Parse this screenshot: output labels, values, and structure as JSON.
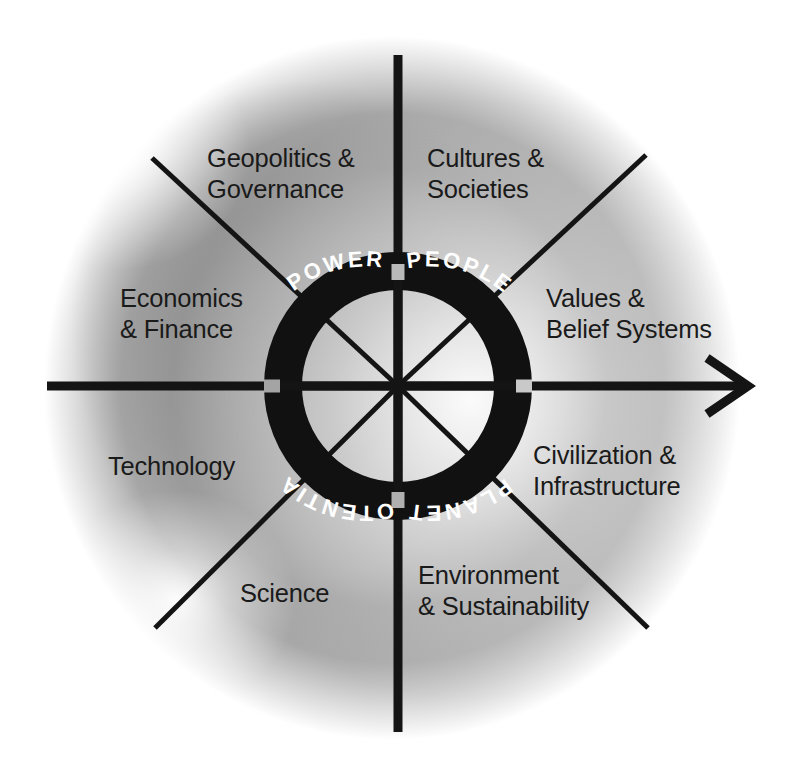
{
  "figure": {
    "type": "conceptual-quadrant-diagram",
    "center": {
      "x": 398,
      "y": 386
    },
    "background_color": "#ffffff",
    "glow_color": "#ffffff",
    "field_color": "#9a9a9a",
    "line_color": "#141414",
    "ring_color": "#111111",
    "ring_text_color": "#ffffff",
    "label_text_color": "#1a1a1a"
  },
  "axes": {
    "horizontal": {
      "name": "horizontal-axis",
      "has_arrowhead": true,
      "arrow_direction": "right"
    },
    "vertical": {
      "name": "vertical-axis",
      "has_arrowhead": false
    }
  },
  "ring": {
    "name": "core-ring",
    "outer_radius": 134,
    "inner_radius": 96,
    "segments": [
      {
        "id": "power",
        "label": "POWER",
        "quadrant": "upper-left"
      },
      {
        "id": "people",
        "label": "PEOPLE",
        "quadrant": "upper-right"
      },
      {
        "id": "planet",
        "label": "PLANET",
        "quadrant": "lower-right"
      },
      {
        "id": "potential",
        "label": "POTENTIAL",
        "quadrant": "lower-left"
      }
    ]
  },
  "quadrant_labels": [
    {
      "id": "geopolitics-governance",
      "text": "Geopolitics &\nGovernance",
      "quadrant": "upper-left",
      "align": "left"
    },
    {
      "id": "economics-finance",
      "text": "Economics\n& Finance",
      "quadrant": "upper-left",
      "align": "left"
    },
    {
      "id": "cultures-societies",
      "text": "Cultures &\nSocieties",
      "quadrant": "upper-right",
      "align": "left"
    },
    {
      "id": "values-belief-systems",
      "text": "Values &\nBelief Systems",
      "quadrant": "upper-right",
      "align": "left"
    },
    {
      "id": "technology",
      "text": "Technology",
      "quadrant": "lower-left",
      "align": "left"
    },
    {
      "id": "science",
      "text": "Science",
      "quadrant": "lower-left",
      "align": "left"
    },
    {
      "id": "civilization-infrastructure",
      "text": "Civilization &\nInfrastructure",
      "quadrant": "lower-right",
      "align": "left"
    },
    {
      "id": "environment-sustainability",
      "text": "Environment\n& Sustainability",
      "quadrant": "lower-right",
      "align": "left"
    }
  ]
}
